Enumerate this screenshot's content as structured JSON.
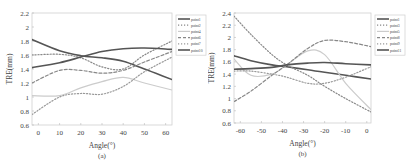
{
  "chart_data": [
    {
      "type": "line",
      "panel_label": "(a)",
      "title": "",
      "xlabel": "Angle(°)",
      "ylabel": "TRE(mm)",
      "xlim": [
        -3,
        63
      ],
      "ylim": [
        0.6,
        2.2
      ],
      "xticks": [
        0,
        10,
        20,
        30,
        40,
        50,
        60
      ],
      "yticks": [
        0.6,
        0.8,
        1,
        1.2,
        1.4,
        1.6,
        1.8,
        2,
        2.2
      ],
      "ytick_labels": [
        "0.6",
        "0.8",
        "1",
        "1.2",
        "1.4",
        "1.6",
        "1.8",
        "2",
        "2.2"
      ],
      "legend_position": "outside right, top",
      "grid": false,
      "x": [
        -3,
        10,
        20,
        30,
        40,
        50,
        63
      ],
      "series": [
        {
          "name": "point1",
          "style": "solid",
          "color": "#555555",
          "width": 1.6,
          "values": [
            1.82,
            1.66,
            1.59,
            1.56,
            1.51,
            1.4,
            1.25
          ]
        },
        {
          "name": "point2",
          "style": "dotted",
          "color": "#888888",
          "width": 1.2,
          "values": [
            1.6,
            1.61,
            1.56,
            1.43,
            1.4,
            1.6,
            1.8
          ]
        },
        {
          "name": "point4",
          "style": "solid",
          "color": "#cccccc",
          "width": 1.2,
          "values": [
            1.02,
            1.02,
            1.13,
            1.22,
            1.28,
            1.2,
            1.1
          ]
        },
        {
          "name": "point6",
          "style": "dashed",
          "color": "#888888",
          "width": 1.2,
          "values": [
            1.2,
            1.38,
            1.38,
            1.34,
            1.38,
            1.5,
            1.65
          ]
        },
        {
          "name": "point7",
          "style": "dotted",
          "color": "#999999",
          "width": 1.2,
          "values": [
            0.75,
            1.0,
            1.05,
            1.04,
            1.15,
            1.36,
            1.57
          ]
        },
        {
          "name": "point10",
          "style": "solid",
          "color": "#555555",
          "width": 1.6,
          "values": [
            1.42,
            1.49,
            1.57,
            1.65,
            1.69,
            1.7,
            1.68
          ]
        }
      ]
    },
    {
      "type": "line",
      "panel_label": "(b)",
      "title": "",
      "xlabel": "Angle(°)",
      "ylabel": "TRE(mm)",
      "xlim": [
        -63,
        2
      ],
      "ylim": [
        0.6,
        2.4
      ],
      "xticks": [
        -60,
        -50,
        -40,
        -30,
        -20,
        -10,
        0
      ],
      "yticks": [
        0.6,
        0.8,
        1,
        1.2,
        1.4,
        1.6,
        1.8,
        2,
        2.2,
        2.4
      ],
      "ytick_labels": [
        "0.6",
        "0.8",
        "1",
        "1.2",
        "1.4",
        "1.6",
        "1.8",
        "2",
        "2.2",
        "2.4"
      ],
      "legend_position": "outside right, top",
      "grid": false,
      "x": [
        -63,
        -55,
        -45,
        -38,
        -28,
        -20,
        -10,
        2
      ],
      "series": [
        {
          "name": "point1",
          "style": "solid",
          "color": "#555555",
          "width": 1.6,
          "values": [
            1.7,
            1.62,
            1.55,
            1.52,
            1.47,
            1.43,
            1.38,
            1.32
          ]
        },
        {
          "name": "point3",
          "style": "dotted",
          "color": "#888888",
          "width": 1.2,
          "values": [
            2.35,
            2.05,
            1.72,
            1.55,
            1.38,
            1.2,
            1.0,
            0.78
          ]
        },
        {
          "name": "point5",
          "style": "solid",
          "color": "#cccccc",
          "width": 1.2,
          "values": [
            1.65,
            1.38,
            1.4,
            1.55,
            1.78,
            1.72,
            1.25,
            0.82
          ]
        },
        {
          "name": "point8",
          "style": "dashed",
          "color": "#888888",
          "width": 1.2,
          "values": [
            0.95,
            1.12,
            1.38,
            1.55,
            1.82,
            1.95,
            1.93,
            1.85
          ]
        },
        {
          "name": "point9",
          "style": "dotted",
          "color": "#999999",
          "width": 1.2,
          "values": [
            1.45,
            1.45,
            1.4,
            1.35,
            1.25,
            1.25,
            1.35,
            1.52
          ]
        },
        {
          "name": "point11",
          "style": "solid",
          "color": "#555555",
          "width": 1.6,
          "values": [
            1.48,
            1.49,
            1.51,
            1.55,
            1.58,
            1.59,
            1.57,
            1.55
          ]
        }
      ]
    }
  ]
}
